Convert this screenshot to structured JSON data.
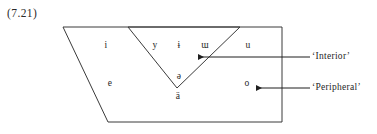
{
  "figure": {
    "example_number": "(7.21)",
    "caption_labels": [
      {
        "id": "interior",
        "text": "‘Interior’"
      },
      {
        "id": "peripheral",
        "text": "‘Peripheral’"
      }
    ]
  },
  "vowels": [
    {
      "id": "i",
      "symbol": "i",
      "x": 106,
      "y": 45,
      "region": "peripheral"
    },
    {
      "id": "y",
      "symbol": "y",
      "x": 155,
      "y": 45,
      "region": "interior"
    },
    {
      "id": "barred-i",
      "symbol": "ɨ",
      "x": 179,
      "y": 45,
      "region": "interior"
    },
    {
      "id": "turned-m",
      "symbol": "ɯ",
      "x": 205,
      "y": 45,
      "region": "interior"
    },
    {
      "id": "u",
      "symbol": "u",
      "x": 248,
      "y": 45,
      "region": "peripheral"
    },
    {
      "id": "e",
      "symbol": "e",
      "x": 110,
      "y": 83,
      "region": "peripheral"
    },
    {
      "id": "schwa",
      "symbol": "ə",
      "x": 179,
      "y": 76,
      "region": "interior"
    },
    {
      "id": "o",
      "symbol": "o",
      "x": 247,
      "y": 83,
      "region": "peripheral"
    },
    {
      "id": "a-diaeresis",
      "symbol": "ä",
      "x": 178,
      "y": 96,
      "region": "peripheral"
    }
  ],
  "geometry": {
    "outer_quadrilateral": "63,27 282,27 282,122 108,122",
    "inner_triangle": "128,27 240,27 177,88",
    "stroke_color": "#3a3a3a",
    "fill_color": "#ffffff",
    "stroke_width": 1
  },
  "annotations": [
    {
      "id": "interior",
      "label": "‘Interior’",
      "label_x": 312,
      "label_y": 51,
      "line_from_x": 310,
      "line_from_y": 57,
      "line_to_x": 198,
      "line_to_y": 57,
      "arrow_direction": "left"
    },
    {
      "id": "peripheral",
      "label": "‘Peripheral’",
      "label_x": 312,
      "label_y": 82,
      "line_from_x": 310,
      "line_from_y": 88,
      "line_to_x": 256,
      "line_to_y": 88,
      "arrow_direction": "left"
    }
  ]
}
